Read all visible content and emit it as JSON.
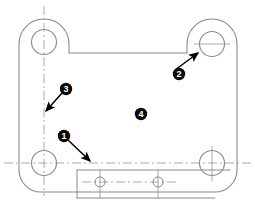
{
  "drawing": {
    "title": "Bracket Plate Outline Drawing",
    "background_color": "#ffffff",
    "line_color": "#808080",
    "outline_color": "#8a8a8a",
    "centerline_color": "#9a9a9a",
    "callout_fill": "#0a0a0a",
    "callout_label_color": "#ffffff",
    "leader_color": "#000000",
    "view_type": "orthographic-plan",
    "width": 255,
    "height": 209
  },
  "callouts": [
    {
      "id": "callout-1",
      "label": "1",
      "cx": 64,
      "cy": 136,
      "r": 6.2,
      "has_leader": true,
      "target_x": 92,
      "target_y": 163,
      "points_to": "bottom-ledge-step-edge"
    },
    {
      "id": "callout-2",
      "label": "2",
      "cx": 179,
      "cy": 74,
      "r": 6.2,
      "has_leader": true,
      "target_x": 200,
      "target_y": 51,
      "points_to": "top-right-mounting-hole"
    },
    {
      "id": "callout-3",
      "label": "3",
      "cx": 66,
      "cy": 89,
      "r": 6.2,
      "has_leader": true,
      "target_x": 44,
      "target_y": 113,
      "points_to": "vertical-centerline"
    },
    {
      "id": "callout-4",
      "label": "4",
      "cx": 141,
      "cy": 114,
      "r": 6.2,
      "has_leader": false,
      "target_x": null,
      "target_y": null,
      "points_to": "plate-face"
    }
  ],
  "holes": [
    {
      "id": "hole-top-left",
      "cx": 44,
      "cy": 42,
      "r": 12.5,
      "type": "mounting-hole"
    },
    {
      "id": "hole-top-right",
      "cx": 212,
      "cy": 44,
      "r": 12.5,
      "type": "mounting-hole"
    },
    {
      "id": "hole-bottom-left",
      "cx": 44,
      "cy": 163,
      "r": 12.5,
      "type": "mounting-hole"
    },
    {
      "id": "hole-bottom-right",
      "cx": 212,
      "cy": 163,
      "r": 12.5,
      "type": "mounting-hole"
    },
    {
      "id": "hole-ledge-left",
      "cx": 100,
      "cy": 182,
      "r": 5.0,
      "type": "small-through-hole"
    },
    {
      "id": "hole-ledge-right",
      "cx": 158,
      "cy": 182,
      "r": 5.0,
      "type": "small-through-hole"
    }
  ],
  "centerlines": [
    {
      "id": "centerline-vertical-left",
      "x1": 44,
      "y1": 6,
      "x2": 44,
      "y2": 196,
      "orientation": "vertical"
    },
    {
      "id": "centerline-horizontal-lower",
      "x1": 4,
      "y1": 163,
      "x2": 251,
      "y2": 163,
      "orientation": "horizontal"
    },
    {
      "id": "centerline-horizontal-ledge",
      "x1": 82,
      "y1": 182,
      "x2": 176,
      "y2": 182,
      "orientation": "horizontal"
    },
    {
      "id": "centerline-vertical-ledge-left",
      "x1": 100,
      "y1": 170,
      "x2": 100,
      "y2": 198,
      "orientation": "vertical"
    },
    {
      "id": "centerline-vertical-ledge-right",
      "x1": 158,
      "y1": 170,
      "x2": 158,
      "y2": 198,
      "orientation": "vertical"
    }
  ]
}
